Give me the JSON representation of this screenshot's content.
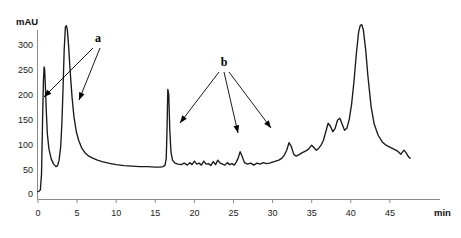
{
  "chart_data": {
    "type": "line",
    "title": "",
    "xlabel": "min",
    "ylabel": "mAU",
    "xlim": [
      -1,
      49
    ],
    "ylim": [
      -18,
      355
    ],
    "grid": false,
    "legend": null,
    "x_ticks": [
      0,
      5,
      10,
      15,
      20,
      25,
      30,
      35,
      40,
      45
    ],
    "x_tick_labels": [
      "0",
      "5",
      "10",
      "15",
      "20",
      "25",
      "30",
      "35",
      "40",
      "45"
    ],
    "y_ticks": [
      0,
      50,
      100,
      150,
      200,
      250,
      300
    ],
    "y_tick_labels": [
      "0",
      "50",
      "100",
      "150",
      "200",
      "250",
      "300"
    ],
    "series": [
      {
        "name": "absorbance",
        "color": "#1a1a1a",
        "x": [
          0.0,
          0.15,
          0.3,
          0.45,
          0.6,
          0.7,
          0.78,
          0.85,
          0.95,
          1.05,
          1.2,
          1.4,
          1.7,
          2.0,
          2.3,
          2.5,
          2.7,
          2.9,
          3.05,
          3.2,
          3.35,
          3.5,
          3.62,
          3.75,
          3.9,
          4.1,
          4.35,
          4.6,
          4.9,
          5.2,
          5.6,
          6.0,
          6.5,
          7.0,
          7.6,
          8.2,
          9.0,
          10.0,
          11.0,
          12.0,
          13.0,
          14.0,
          15.0,
          15.6,
          16.0,
          16.25,
          16.4,
          16.5,
          16.6,
          16.72,
          16.85,
          17.0,
          17.2,
          17.5,
          17.9,
          18.3,
          18.7,
          19.1,
          19.4,
          19.7,
          20.0,
          20.3,
          20.6,
          20.9,
          21.2,
          21.5,
          21.8,
          22.1,
          22.4,
          22.7,
          23.0,
          23.3,
          23.6,
          23.9,
          24.2,
          24.5,
          24.8,
          25.1,
          25.35,
          25.6,
          25.85,
          26.1,
          26.4,
          26.8,
          27.2,
          27.6,
          28.0,
          28.4,
          28.8,
          29.2,
          29.6,
          30.0,
          30.4,
          30.8,
          31.2,
          31.5,
          31.8,
          32.1,
          32.4,
          32.7,
          33.0,
          33.4,
          33.8,
          34.2,
          34.6,
          35.0,
          35.3,
          35.6,
          35.9,
          36.2,
          36.5,
          36.8,
          37.1,
          37.4,
          37.7,
          38.0,
          38.3,
          38.6,
          38.9,
          39.2,
          39.5,
          39.8,
          40.1,
          40.4,
          40.7,
          41.0,
          41.2,
          41.4,
          41.6,
          41.9,
          42.2,
          42.6,
          43.0,
          43.5,
          44.0,
          44.5,
          45.0,
          45.5,
          46.0,
          46.4,
          46.8,
          47.1,
          47.4,
          47.6
        ],
        "y": [
          5,
          6,
          8,
          40,
          160,
          230,
          255,
          250,
          215,
          170,
          120,
          90,
          70,
          60,
          55,
          57,
          68,
          95,
          140,
          210,
          290,
          335,
          338,
          330,
          300,
          250,
          195,
          155,
          125,
          108,
          92,
          83,
          76,
          72,
          68,
          65,
          62,
          59,
          57,
          56,
          55,
          55,
          54,
          54,
          55,
          58,
          72,
          130,
          210,
          200,
          130,
          85,
          68,
          62,
          60,
          59,
          62,
          58,
          63,
          59,
          66,
          60,
          62,
          58,
          66,
          60,
          61,
          57,
          65,
          59,
          68,
          62,
          60,
          58,
          63,
          59,
          61,
          58,
          64,
          72,
          85,
          76,
          63,
          60,
          62,
          58,
          62,
          60,
          63,
          61,
          62,
          64,
          66,
          68,
          72,
          78,
          88,
          103,
          95,
          80,
          76,
          79,
          83,
          86,
          90,
          98,
          93,
          88,
          92,
          98,
          108,
          125,
          142,
          136,
          125,
          132,
          148,
          152,
          140,
          128,
          132,
          150,
          180,
          225,
          280,
          325,
          338,
          340,
          330,
          290,
          235,
          175,
          140,
          118,
          105,
          98,
          94,
          90,
          86,
          80,
          88,
          82,
          74,
          72
        ]
      }
    ],
    "annotations": [
      {
        "label": "a",
        "label_x": 98,
        "label_y": 42,
        "arrows": [
          {
            "from_x": 93,
            "from_y": 48,
            "to_x": 44,
            "to_y": 97
          },
          {
            "from_x": 100,
            "from_y": 48,
            "to_x": 79,
            "to_y": 100
          }
        ]
      },
      {
        "label": "b",
        "label_x": 224,
        "label_y": 66,
        "arrows": [
          {
            "from_x": 219,
            "from_y": 72,
            "to_x": 180,
            "to_y": 123
          },
          {
            "from_x": 224,
            "from_y": 72,
            "to_x": 238,
            "to_y": 133
          },
          {
            "from_x": 229,
            "from_y": 72,
            "to_x": 271,
            "to_y": 128
          }
        ]
      }
    ]
  }
}
